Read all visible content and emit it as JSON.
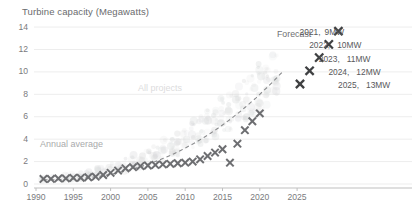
{
  "chart_title": "Turbine capacity (Megawatts)",
  "annotations": {
    "annual_average": "Annual average",
    "all_projects": "All projects",
    "forecast": "Forecast"
  },
  "axis": {
    "y_ticks": [
      "0",
      "2",
      "4",
      "6",
      "8",
      "10",
      "12",
      "14"
    ],
    "x_ticks": [
      "1990",
      "1995",
      "2000",
      "2005",
      "2010",
      "2015",
      "2020",
      "2025"
    ]
  },
  "forecast_labels": [
    {
      "year": "2025,",
      "value": "13MW"
    },
    {
      "year": "2024,",
      "value": "12MW"
    },
    {
      "year": "2023,",
      "value": "11MW"
    },
    {
      "year": "2022,",
      "value": "10MW"
    },
    {
      "year": "2021,",
      "value": "9MW"
    }
  ],
  "colors": {
    "marker": "#6d6e71",
    "forecast_marker": "#3f4042",
    "cloud": "#d8d9da",
    "grid": "#ededed",
    "axis": "#bfbfbf",
    "text": "#58595b",
    "muted_text": "#a9aaac",
    "faint_text": "#dcdcdd"
  },
  "chart_data": {
    "type": "scatter",
    "title": "Turbine capacity (Megawatts)",
    "xlabel": "",
    "ylabel": "Turbine capacity (Megawatts)",
    "xlim": [
      1990,
      2027
    ],
    "ylim": [
      0,
      14
    ],
    "grid": true,
    "legend": false,
    "series": [
      {
        "name": "Annual average",
        "marker": "x",
        "x": [
          1991,
          1992,
          1993,
          1994,
          1995,
          1996,
          1997,
          1998,
          1999,
          2000,
          2001,
          2002,
          2003,
          2004,
          2005,
          2006,
          2007,
          2008,
          2009,
          2010,
          2011,
          2012,
          2013,
          2014,
          2015,
          2016,
          2017,
          2018,
          2019,
          2020
        ],
        "y": [
          0.45,
          0.45,
          0.5,
          0.5,
          0.55,
          0.55,
          0.6,
          0.65,
          0.8,
          1.0,
          1.2,
          1.4,
          1.5,
          1.6,
          1.65,
          1.7,
          1.75,
          1.8,
          1.85,
          1.9,
          2.0,
          2.2,
          2.5,
          2.8,
          3.1,
          1.9,
          3.6,
          4.8,
          5.6,
          6.3
        ]
      },
      {
        "name": "Forecast",
        "marker": "x",
        "x": [
          2021,
          2022,
          2023,
          2024,
          2025
        ],
        "y": [
          9,
          10,
          11,
          12,
          13
        ]
      },
      {
        "name": "All projects",
        "marker": "o",
        "note": "faint grey cloud of individual project capacities behind the annual averages"
      },
      {
        "name": "Trend",
        "style": "dashed",
        "x": [
          1991,
          2000,
          2010,
          2015,
          2020,
          2022
        ],
        "y": [
          0.4,
          1.0,
          2.0,
          3.0,
          5.6,
          8.6
        ]
      }
    ]
  }
}
